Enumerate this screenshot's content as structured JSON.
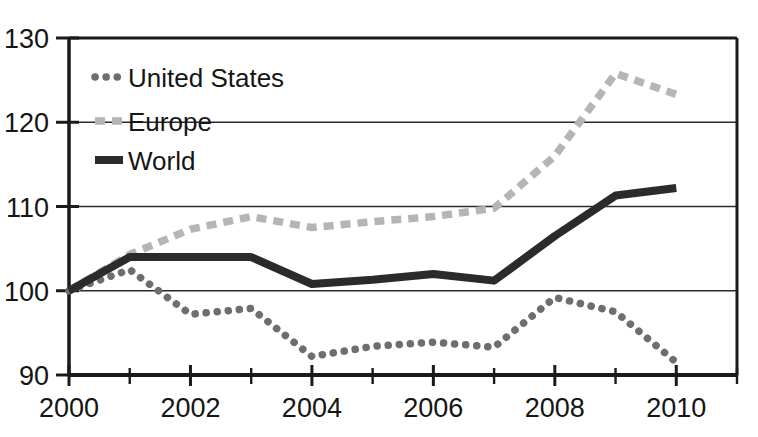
{
  "chart_data": {
    "type": "line",
    "title": "",
    "xlabel": "",
    "ylabel": "",
    "x": [
      2000,
      2001,
      2002,
      2003,
      2004,
      2005,
      2006,
      2007,
      2008,
      2009,
      2010
    ],
    "xlim": [
      2000,
      2011
    ],
    "ylim": [
      90,
      130
    ],
    "grid": true,
    "gridlines_y": [
      100,
      110,
      120
    ],
    "legend_position": "top-left-inside",
    "y_ticks": [
      90,
      100,
      110,
      120,
      130
    ],
    "y_tick_labels": [
      "90",
      "100",
      "110",
      "120",
      "130"
    ],
    "x_ticks": [
      2000,
      2001,
      2002,
      2003,
      2004,
      2005,
      2006,
      2007,
      2008,
      2009,
      2010,
      2011
    ],
    "x_tick_labels_major": [
      "2000",
      "2002",
      "2004",
      "2006",
      "2008",
      "2010"
    ],
    "x_ticks_major": [
      2000,
      2002,
      2004,
      2006,
      2008,
      2010
    ],
    "series": [
      {
        "name": "United States",
        "style": "dotted",
        "color": "#6e6e6e",
        "values": [
          100,
          102.5,
          97.2,
          97.9,
          92.2,
          93.4,
          93.9,
          93.3,
          99.2,
          97.5,
          91.5
        ]
      },
      {
        "name": "Europe",
        "style": "dashed",
        "color": "#b5b5b5",
        "values": [
          100,
          104.3,
          107.3,
          108.8,
          107.5,
          108.2,
          108.8,
          109.8,
          116.0,
          125.8,
          123.3
        ]
      },
      {
        "name": "World",
        "style": "solid",
        "color": "#2b2b2b",
        "values": [
          100,
          104.0,
          104.0,
          104.0,
          100.8,
          101.3,
          102.0,
          101.2,
          106.5,
          111.3,
          112.2
        ]
      }
    ]
  },
  "legend": {
    "items": [
      {
        "label": "United States",
        "swatch": "dotted-swatch",
        "color": "#6e6e6e"
      },
      {
        "label": "Europe",
        "swatch": "dashed-swatch",
        "color": "#b5b5b5"
      },
      {
        "label": "World",
        "swatch": "solid-swatch",
        "color": "#2b2b2b"
      }
    ]
  },
  "axes": {
    "y_labels": [
      "130",
      "120",
      "110",
      "100",
      "90"
    ],
    "x_labels": [
      "2000",
      "2002",
      "2004",
      "2006",
      "2008",
      "2010"
    ]
  },
  "colors": {
    "axis": "#1a1a1a",
    "grid": "#2a2a2a",
    "background": "#ffffff",
    "united_states": "#6e6e6e",
    "europe": "#b5b5b5",
    "world": "#2b2b2b"
  }
}
